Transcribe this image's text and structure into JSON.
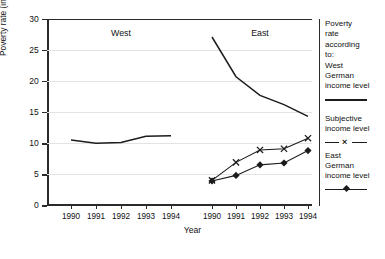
{
  "chart_data": {
    "type": "line",
    "title": "",
    "xlabel": "Year",
    "ylabel": "Poverty rate (in %)",
    "ylim": [
      0,
      30
    ],
    "yticks": [
      0,
      5,
      10,
      15,
      20,
      25,
      30
    ],
    "grid": true,
    "legend_position": "right",
    "panels": [
      {
        "name": "West",
        "x": [
          "1990",
          "1991",
          "1992",
          "1993",
          "1994"
        ],
        "series": [
          {
            "name": "West German income level",
            "marker": "none",
            "values": [
              10.5,
              10.0,
              10.1,
              11.1,
              11.2
            ]
          }
        ]
      },
      {
        "name": "East",
        "x": [
          "1990",
          "1991",
          "1992",
          "1993",
          "1994"
        ],
        "series": [
          {
            "name": "West German income level",
            "marker": "none",
            "values": [
              27.1,
              20.7,
              17.7,
              16.2,
              14.3
            ]
          },
          {
            "name": "Subjective income level",
            "marker": "x",
            "values": [
              4.0,
              6.9,
              8.9,
              9.1,
              10.8
            ]
          },
          {
            "name": "East German income level",
            "marker": "diamond",
            "values": [
              3.9,
              4.8,
              6.5,
              6.8,
              8.8
            ]
          }
        ]
      }
    ]
  },
  "axis": {
    "y_label": "Poverty rate (in %)",
    "x_label": "Year",
    "y_ticks": [
      "0",
      "5",
      "10",
      "15",
      "20",
      "25",
      "30"
    ],
    "x_ticks_west": [
      "1990",
      "1991",
      "1992",
      "1993",
      "1994"
    ],
    "x_ticks_east": [
      "1990",
      "1991",
      "1992",
      "1993",
      "1994"
    ]
  },
  "panels": {
    "west_title": "West",
    "east_title": "East"
  },
  "legend": {
    "heading_line1": "Poverty",
    "heading_line2": "rate",
    "heading_line3": "according",
    "heading_line4": "to:",
    "item1_line1": "West",
    "item1_line2": "German",
    "item1_line3": "income level",
    "item2_line1": "Subjective",
    "item2_line2": "income level",
    "item2_marker": "×",
    "item3_line1": "East",
    "item3_line2": "German",
    "item3_line3": "income level"
  }
}
